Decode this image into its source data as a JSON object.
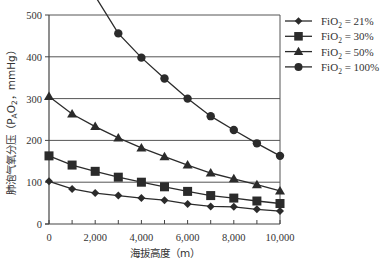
{
  "chart_data": {
    "type": "line",
    "title": "",
    "xlabel": "海拔高度（m）",
    "ylabel": "肺泡气氧分压（P_AO_2，mmHg）",
    "ylabel_parts": {
      "main": "肺泡气氧分压（P",
      "sub1": "A",
      "mid": "O",
      "sub2": "2",
      "end": "，mmHg）"
    },
    "xlim": [
      0,
      10000
    ],
    "ylim": [
      0,
      500
    ],
    "grid": {
      "horizontal": true,
      "vertical": false
    },
    "legend_position": "right-top",
    "x": [
      0,
      1000,
      2000,
      3000,
      4000,
      5000,
      6000,
      7000,
      8000,
      9000,
      10000
    ],
    "x_ticks": [
      0,
      2000,
      4000,
      6000,
      8000,
      10000
    ],
    "x_tick_labels": [
      "0",
      "2,000",
      "4,000",
      "6,000",
      "8,000",
      "10,000"
    ],
    "x_minor_ticks": [
      1000,
      3000,
      5000,
      7000,
      9000
    ],
    "y_ticks": [
      0,
      100,
      200,
      300,
      400,
      500
    ],
    "y_tick_labels": [
      "0",
      "100",
      "200",
      "300",
      "400",
      "500"
    ],
    "series": [
      {
        "name": "FiO2 = 21%",
        "label_prefix": "FiO",
        "label_sub": "2",
        "label_suffix": " = 21%",
        "marker": "diamond",
        "values": [
          102,
          84,
          74,
          68,
          62,
          57,
          48,
          42,
          41,
          35,
          31
        ]
      },
      {
        "name": "FiO2 = 30%",
        "label_prefix": "FiO",
        "label_sub": "2",
        "label_suffix": " = 30%",
        "marker": "square",
        "values": [
          163,
          141,
          126,
          112,
          100,
          89,
          78,
          68,
          62,
          55,
          49
        ]
      },
      {
        "name": "FiO2 = 50%",
        "label_prefix": "FiO",
        "label_sub": "2",
        "label_suffix": " = 50%",
        "marker": "triangle",
        "values": [
          305,
          263,
          233,
          206,
          182,
          161,
          141,
          122,
          108,
          94,
          79
        ]
      },
      {
        "name": "FiO2 = 100%",
        "label_prefix": "FiO",
        "label_sub": "2",
        "label_suffix": " = 100%",
        "marker": "circle",
        "values": [
          null,
          null,
          545,
          456,
          398,
          348,
          300,
          258,
          225,
          193,
          163
        ]
      }
    ]
  },
  "colors": {
    "line": "#2b2b2b",
    "grid": "#555555",
    "axis": "#444444",
    "background": "#ffffff"
  }
}
